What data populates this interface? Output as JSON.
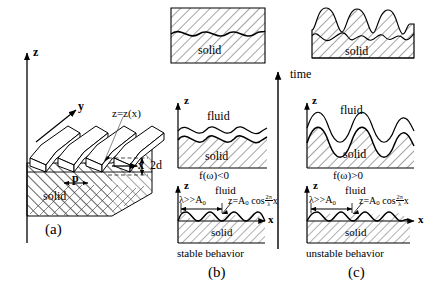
{
  "figure": {
    "caption_a": "(a)",
    "caption_b": "(b)",
    "caption_c": "(c)",
    "time_label": "time",
    "background": "#ffffff",
    "ink": "#000000",
    "hatch_color": "#333333"
  },
  "panel_a": {
    "name": "three-dimensional corrugated solid surface",
    "axis_z": "z",
    "axis_y": "y",
    "axis_x": "x",
    "surface_equation": "z=z(x)",
    "depth_label": "2d",
    "pitch_label": "p",
    "material_label": "solid",
    "caption": "(a)"
  },
  "panel_b": {
    "name": "stable behavior column",
    "behavior_label": "stable behavior",
    "caption": "(b)",
    "frames": [
      {
        "id": "b-top",
        "order": 3,
        "time_stage": "late",
        "material_label": "solid",
        "fluid_label": "",
        "description": "flattened solid, corrugation nearly decayed"
      },
      {
        "id": "b-middle",
        "order": 2,
        "time_stage": "intermediate",
        "axis_z": "z",
        "fluid_label": "fluid",
        "material_label": "solid",
        "condition": "f(ω)<0",
        "description": "reduced amplitude ripples at solid-fluid interface"
      },
      {
        "id": "b-bottom",
        "order": 1,
        "time_stage": "initial",
        "axis_z": "z",
        "axis_x": "x",
        "fluid_label": "fluid",
        "material_label": "solid",
        "wavelength_condition": "λ>>A₀",
        "profile_equation": "z=A₀ cos (2π/λ) x",
        "description": "initial sinusoidal perturbation"
      }
    ]
  },
  "panel_c": {
    "name": "unstable behavior column",
    "behavior_label": "unstable behavior",
    "caption": "(c)",
    "frames": [
      {
        "id": "c-top",
        "order": 3,
        "time_stage": "late",
        "material_label": "solid",
        "description": "strongly amplified sharp peaks"
      },
      {
        "id": "c-middle",
        "order": 2,
        "time_stage": "intermediate",
        "axis_z": "z",
        "fluid_label": "fluid",
        "material_label": "solid",
        "condition": "f(ω)>0",
        "description": "growing amplitude ripples at solid-fluid interface"
      },
      {
        "id": "c-bottom",
        "order": 1,
        "time_stage": "initial",
        "axis_z": "z",
        "axis_x": "x",
        "fluid_label": "fluid",
        "material_label": "solid",
        "wavelength_condition": "λ>>A₀",
        "profile_equation": "z=A₀ cos (2π/λ) x",
        "description": "initial sinusoidal perturbation"
      }
    ]
  },
  "math": {
    "lambda": "λ",
    "gg": ">>",
    "A": "A",
    "zero": "0",
    "z_eq": "z=A",
    "cos": "cos",
    "two_pi": "2π",
    "x": "x",
    "f_omega_neg": "f(ω)<0",
    "f_omega_pos": "f(ω)>0",
    "z_of_x": "z=z(x)"
  }
}
